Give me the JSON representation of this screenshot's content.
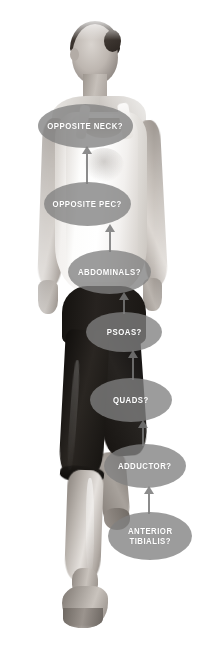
{
  "image": {
    "subject": "standing female figure, grayscale photo, single-leg stance",
    "background_color": "#ffffff",
    "width": 210,
    "height": 659
  },
  "annotations": {
    "bubble_fill": "#808080",
    "label_color": "#ffffff",
    "arrow_color": "#787878",
    "bubbles": [
      {
        "id": "opposite-neck",
        "label": "OPPOSITE NECK?",
        "x": 38,
        "y": 104,
        "w": 95,
        "h": 44,
        "font_size": 9.5
      },
      {
        "id": "opposite-pec",
        "label": "OPPOSITE PEC?",
        "x": 44,
        "y": 182,
        "w": 87,
        "h": 44,
        "font_size": 9.5
      },
      {
        "id": "abdominals",
        "label": "ABDOMINALS?",
        "x": 68,
        "y": 250,
        "w": 83,
        "h": 44,
        "font_size": 9.5
      },
      {
        "id": "psoas",
        "label": "PSOAS?",
        "x": 86,
        "y": 312,
        "w": 76,
        "h": 40,
        "font_size": 9.5
      },
      {
        "id": "quads",
        "label": "QUADS?",
        "x": 90,
        "y": 378,
        "w": 82,
        "h": 44,
        "font_size": 9.5
      },
      {
        "id": "adductor",
        "label": "ADDUCTOR?",
        "x": 104,
        "y": 444,
        "w": 82,
        "h": 44,
        "font_size": 9.5
      },
      {
        "id": "anterior-tibialis",
        "label": "ANTERIOR\nTIBIALIS?",
        "x": 108,
        "y": 512,
        "w": 84,
        "h": 48,
        "font_size": 9.5
      }
    ],
    "arrows": [
      {
        "id": "arrow-pec-to-neck",
        "from": "opposite-pec",
        "to": "opposite-neck",
        "x": 82,
        "y": 146,
        "h": 38,
        "direction": "up"
      },
      {
        "id": "arrow-abdominals-to-pec",
        "from": "abdominals",
        "to": "opposite-pec",
        "x": 105,
        "y": 224,
        "h": 28,
        "direction": "up"
      },
      {
        "id": "arrow-psoas-to-abdominals",
        "from": "psoas",
        "to": "abdominals",
        "x": 119,
        "y": 292,
        "h": 22,
        "direction": "up"
      },
      {
        "id": "arrow-quads-to-psoas",
        "from": "quads",
        "to": "psoas",
        "x": 128,
        "y": 350,
        "h": 30,
        "direction": "up"
      },
      {
        "id": "arrow-adductor-to-quads",
        "from": "adductor",
        "to": "quads",
        "x": 138,
        "y": 420,
        "h": 26,
        "direction": "up"
      },
      {
        "id": "arrow-tibialis-to-adductor",
        "from": "anterior-tibialis",
        "to": "adductor",
        "x": 144,
        "y": 486,
        "h": 28,
        "direction": "up"
      }
    ]
  }
}
